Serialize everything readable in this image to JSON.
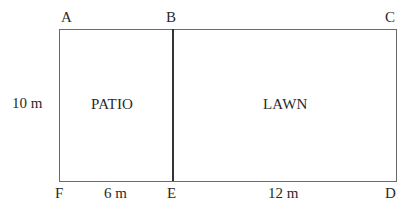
{
  "diagram": {
    "type": "garden-plan",
    "points": {
      "A": "A",
      "B": "B",
      "C": "C",
      "D": "D",
      "E": "E",
      "F": "F"
    },
    "regions": {
      "patio": "PATIO",
      "lawn": "LAWN"
    },
    "dimensions": {
      "height": "10 m",
      "patio_width": "6 m",
      "lawn_width": "12 m"
    },
    "colors": {
      "border": "#6a6a6a",
      "divider": "#333333",
      "text": "#2a2a2a",
      "background": "#ffffff"
    }
  }
}
